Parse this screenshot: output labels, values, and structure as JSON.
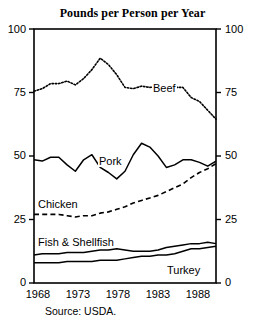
{
  "chart_data": {
    "type": "line",
    "title": "Pounds per Person per Year",
    "xlabel": "",
    "ylabel": "",
    "xlim": [
      1968,
      1990
    ],
    "ylim": [
      0,
      100
    ],
    "grid": false,
    "legend_position": "inline-labels",
    "y_ticks": [
      "0",
      "25",
      "50",
      "75",
      "100"
    ],
    "y_tick_values": [
      0,
      25,
      50,
      75,
      100
    ],
    "y_axis_both_sides": true,
    "x_ticks": [
      "1968",
      "1973",
      "1978",
      "1983",
      "1988"
    ],
    "x_tick_values": [
      1968,
      1973,
      1978,
      1983,
      1988
    ],
    "x": [
      1968,
      1969,
      1970,
      1971,
      1972,
      1973,
      1974,
      1975,
      1976,
      1977,
      1978,
      1979,
      1980,
      1981,
      1982,
      1983,
      1984,
      1985,
      1986,
      1987,
      1988,
      1989,
      1990
    ],
    "series": [
      {
        "name": "Beef",
        "style": "dotted",
        "values": [
          75.5,
          76.5,
          78.5,
          78.5,
          79.5,
          78.0,
          80.5,
          84.0,
          88.5,
          86.0,
          82.0,
          77.0,
          76.5,
          77.5,
          77.0,
          77.5,
          77.5,
          77.0,
          77.0,
          73.0,
          71.5,
          68.0,
          64.5
        ]
      },
      {
        "name": "Pork",
        "style": "solid",
        "values": [
          48.5,
          48.0,
          49.5,
          49.5,
          46.5,
          44.0,
          48.5,
          50.5,
          45.5,
          43.5,
          41.0,
          44.0,
          50.5,
          55.0,
          53.5,
          50.0,
          45.5,
          46.5,
          48.5,
          48.5,
          47.5,
          46.0,
          48.0
        ]
      },
      {
        "name": "Chicken",
        "style": "dashed",
        "values": [
          27.0,
          27.0,
          27.0,
          27.0,
          26.5,
          26.0,
          26.5,
          26.5,
          27.5,
          28.0,
          29.0,
          30.0,
          31.5,
          32.5,
          33.5,
          34.5,
          36.0,
          37.5,
          39.0,
          41.5,
          43.5,
          45.0,
          47.0
        ]
      },
      {
        "name": "Fish & Shellfish",
        "style": "solid",
        "values": [
          11.0,
          11.5,
          11.5,
          11.5,
          12.0,
          12.0,
          12.0,
          12.5,
          13.0,
          13.0,
          13.5,
          13.0,
          12.5,
          12.5,
          12.5,
          13.0,
          14.0,
          14.5,
          15.0,
          15.5,
          15.5,
          16.0,
          15.5
        ]
      },
      {
        "name": "Turkey",
        "style": "solid",
        "values": [
          8.0,
          8.0,
          8.0,
          8.0,
          8.5,
          8.5,
          8.5,
          8.5,
          9.0,
          9.0,
          9.0,
          9.5,
          10.0,
          10.5,
          10.5,
          11.0,
          11.0,
          11.5,
          12.5,
          13.5,
          13.5,
          14.0,
          14.5
        ]
      }
    ],
    "annotations": [
      {
        "text": "Beef",
        "x": 1982,
        "y": 84
      },
      {
        "text": "Pork",
        "x": 1975.5,
        "y": 41
      },
      {
        "text": "Chicken",
        "x": 1968.5,
        "y": 31
      },
      {
        "text": "Fish & Shellfish",
        "x": 1968.5,
        "y": 18
      },
      {
        "text": "Turkey",
        "x": 1986,
        "y": 6
      }
    ],
    "source_note": "Source: USDA."
  },
  "ticks": {
    "y": {
      "t100": "100",
      "t75": "75",
      "t50": "50",
      "t25": "25",
      "t0": "0"
    },
    "x": {
      "x1968": "1968",
      "x1973": "1973",
      "x1978": "1978",
      "x1983": "1983",
      "x1988": "1988"
    }
  },
  "labels": {
    "beef": "Beef",
    "pork": "Pork",
    "chicken": "Chicken",
    "fish": "Fish & Shellfish",
    "turkey": "Turkey"
  },
  "colors": {
    "axis": "#000000",
    "line": "#000000",
    "background": "#ffffff",
    "text": "#000000"
  },
  "source": "Source: USDA."
}
